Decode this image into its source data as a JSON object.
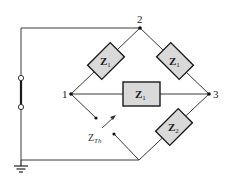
{
  "diagram": {
    "type": "circuit-bridge",
    "nodes": [
      {
        "id": "node-1",
        "label": "1",
        "x": 71,
        "y": 94
      },
      {
        "id": "node-2",
        "label": "2",
        "x": 140,
        "y": 28
      },
      {
        "id": "node-3",
        "label": "3",
        "x": 209,
        "y": 94
      }
    ],
    "impedances": [
      {
        "id": "z-1-2",
        "label": "Z",
        "sub": "1",
        "between": [
          "1",
          "2"
        ]
      },
      {
        "id": "z-2-3",
        "label": "Z",
        "sub": "1",
        "between": [
          "2",
          "3"
        ]
      },
      {
        "id": "z-1-3",
        "label": "Z",
        "sub": "1",
        "between": [
          "1",
          "3"
        ]
      },
      {
        "id": "z-3-bottom",
        "label": "Z",
        "sub": "2",
        "between": [
          "3",
          "bottom"
        ]
      }
    ],
    "thevenin": {
      "label": "Z",
      "sub": "Th"
    },
    "source": {
      "type": "open-switch-terminals"
    },
    "ground": {
      "type": "ground-symbol"
    },
    "colors": {
      "wire": "#3a3a3a",
      "box_fill": "#d9d9d9",
      "box_stroke": "#1a1a1a"
    }
  }
}
